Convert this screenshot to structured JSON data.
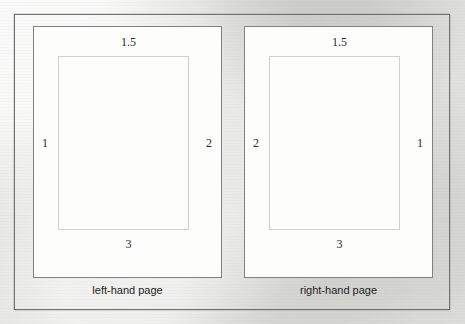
{
  "figure": {
    "background_color": "#e1e2de",
    "frame_color": "#6f7370",
    "page_fill_color": "#fdfdfc",
    "page_border_color": "#7e8280",
    "text_block_border_color": "#cfd1cf",
    "label_color": "#25282a"
  },
  "pages": [
    {
      "id": "left-hand",
      "caption": "left-hand page",
      "margins": {
        "top": "1.5",
        "bottom": "3",
        "left": "1",
        "right": "2"
      }
    },
    {
      "id": "right-hand",
      "caption": "right-hand page",
      "margins": {
        "top": "1.5",
        "bottom": "3",
        "left": "2",
        "right": "1"
      }
    }
  ]
}
